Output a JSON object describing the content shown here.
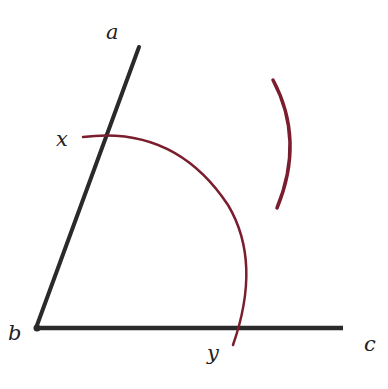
{
  "diagram": {
    "labels": {
      "a": "a",
      "b": "b",
      "c": "c",
      "x": "x",
      "y": "y"
    },
    "colors": {
      "ray": "#2a2a2a",
      "arc": "#7a1e2e",
      "background": "#ffffff"
    },
    "points": {
      "b": [
        36,
        328
      ],
      "a_end": [
        139,
        47
      ],
      "c_end": [
        343,
        328
      ],
      "x": [
        106,
        135
      ],
      "y": [
        235,
        328
      ]
    }
  }
}
